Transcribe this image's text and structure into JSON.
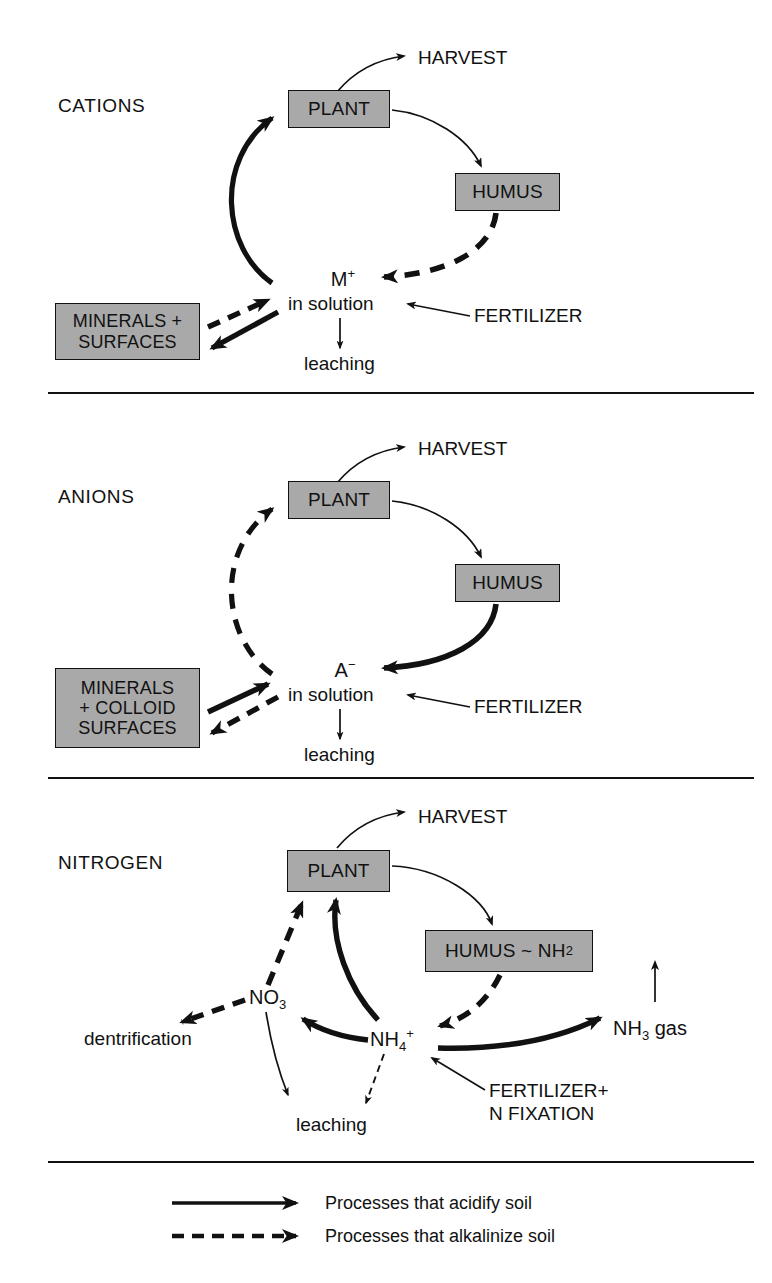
{
  "figure": {
    "kind": "three-panel nutrient cycle diagram",
    "panels": [
      "CATIONS",
      "ANIONS",
      "NITROGEN"
    ]
  },
  "panel_cations": {
    "title": "CATIONS",
    "plant": "PLANT",
    "humus": "HUMUS",
    "harvest": "HARVEST",
    "minerals": "MINERALS +\nSURFACES",
    "ion_symbol": "M",
    "ion_charge": "+",
    "ion_state": "in solution",
    "fertilizer": "FERTILIZER",
    "leaching": "leaching"
  },
  "panel_anions": {
    "title": "ANIONS",
    "plant": "PLANT",
    "humus": "HUMUS",
    "harvest": "HARVEST",
    "minerals": "MINERALS\n+ COLLOID\nSURFACES",
    "ion_symbol": "A",
    "ion_charge": "−",
    "ion_state": "in solution",
    "fertilizer": "FERTILIZER",
    "leaching": "leaching"
  },
  "panel_nitrogen": {
    "title": "NITROGEN",
    "plant": "PLANT",
    "humus": "HUMUS ~ NH",
    "humus_sub": "2",
    "harvest": "HARVEST",
    "nitrate": "NO",
    "nitrate_sub": "3",
    "ammonium": "NH",
    "ammonium_sub": "4",
    "ammonium_sup": "+",
    "ammonia_gas": "NH",
    "ammonia_gas_sub": "3",
    "ammonia_gas_tail": " gas",
    "dentrification": "dentrification",
    "leaching": "leaching",
    "fertilizer": "FERTILIZER+\nN FIXATION"
  },
  "legend": {
    "solid_label": "Processes that acidify soil",
    "dashed_label": "Processes that alkalinize soil"
  },
  "colors": {
    "box_fill": "#a9a9a9",
    "stroke": "#111111",
    "background": "#ffffff"
  }
}
